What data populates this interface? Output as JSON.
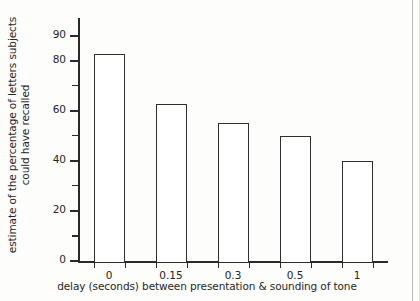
{
  "chart_data": {
    "type": "bar",
    "title": "",
    "xlabel": "delay (seconds) between presentation & sounding of tone",
    "ylabel_lines": [
      "estimate of the percentage of letters subjects",
      "could have recalled"
    ],
    "categories": [
      "0",
      "0.15",
      "0.3",
      "0.5",
      "1"
    ],
    "values": [
      82.5,
      62.5,
      55,
      50,
      40
    ],
    "ylim": [
      0,
      97
    ],
    "xlim_categories": 5,
    "y_major_ticks": [
      0,
      20,
      40,
      60,
      80,
      90
    ],
    "y_minor_ticks": [
      10,
      30,
      50,
      70
    ],
    "y_tick_labels": [
      "0",
      "20",
      "40",
      "60",
      "80",
      "90"
    ],
    "grid": false,
    "legend": null,
    "bar_fill_color": "#ffffff",
    "bar_edge_color": "#2f2f2f",
    "axis_color": "#2a2a2a",
    "background_color": "#fdfdfb",
    "text_color": "#262626"
  }
}
